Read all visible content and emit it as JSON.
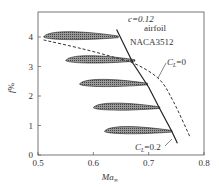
{
  "chart_data": {
    "type": "line",
    "title": "",
    "xlabel": "Ma∞",
    "ylabel": "f%",
    "xlim": [
      0.5,
      0.8
    ],
    "ylim": [
      0,
      4.8
    ],
    "xticks": [
      "0.5",
      "0.6",
      "0.7",
      "0.8"
    ],
    "yticks": [
      "0",
      "1",
      "2",
      "3",
      "4"
    ],
    "grid": false,
    "annotations": [
      "c=0.12",
      "airfoil",
      "NACA3512",
      "CL=0",
      "CL=0.2"
    ],
    "series": [
      {
        "name": "CL=0.2",
        "style": "solid",
        "x": [
          0.642,
          0.672,
          0.7,
          0.722,
          0.742,
          0.752
        ],
        "y": [
          4.25,
          3.1,
          2.3,
          1.5,
          0.8,
          0.4
        ]
      },
      {
        "name": "CL=0",
        "style": "dashed",
        "x": [
          0.51,
          0.58,
          0.64,
          0.68,
          0.72,
          0.745,
          0.775
        ],
        "y": [
          3.9,
          3.6,
          3.3,
          3.05,
          2.55,
          1.8,
          0.6
        ]
      }
    ],
    "airfoils": [
      {
        "f": 4.0,
        "x_start": 0.51,
        "x_end": 0.645
      },
      {
        "f": 3.2,
        "x_start": 0.55,
        "x_end": 0.675
      },
      {
        "f": 2.4,
        "x_start": 0.575,
        "x_end": 0.698
      },
      {
        "f": 1.6,
        "x_start": 0.6,
        "x_end": 0.72
      },
      {
        "f": 0.8,
        "x_start": 0.62,
        "x_end": 0.742
      }
    ]
  },
  "labels": {
    "c": "c=0.12",
    "airfoil": "airfoil",
    "naca": "NACA3512",
    "cl0": "=0",
    "cl02": "=0.2",
    "cl_sym": "C",
    "cl_sub": "L",
    "ylabel_f": "f",
    "ylabel_pct": "%",
    "xlabel_ma": "Ma",
    "xlabel_sub": "∞"
  }
}
